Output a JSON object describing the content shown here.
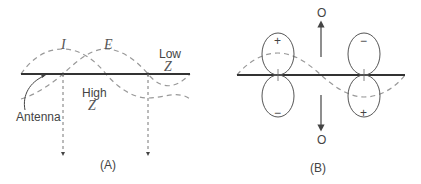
{
  "diagram_a": {
    "caption": "(A)",
    "current_label": "I",
    "voltage_label": "E",
    "low_label": "Low",
    "low_z": "Z",
    "high_label": "High",
    "high_z": "Z",
    "antenna_label": "Antenna"
  },
  "diagram_b": {
    "caption": "(B)",
    "top_null": "O",
    "bottom_null": "O",
    "lobe_signs": {
      "left_top": "+",
      "left_bottom": "−",
      "right_top": "−",
      "right_bottom": "+"
    }
  },
  "colors": {
    "line": "#333333",
    "wave": "#999999",
    "lobe": "#555555"
  }
}
